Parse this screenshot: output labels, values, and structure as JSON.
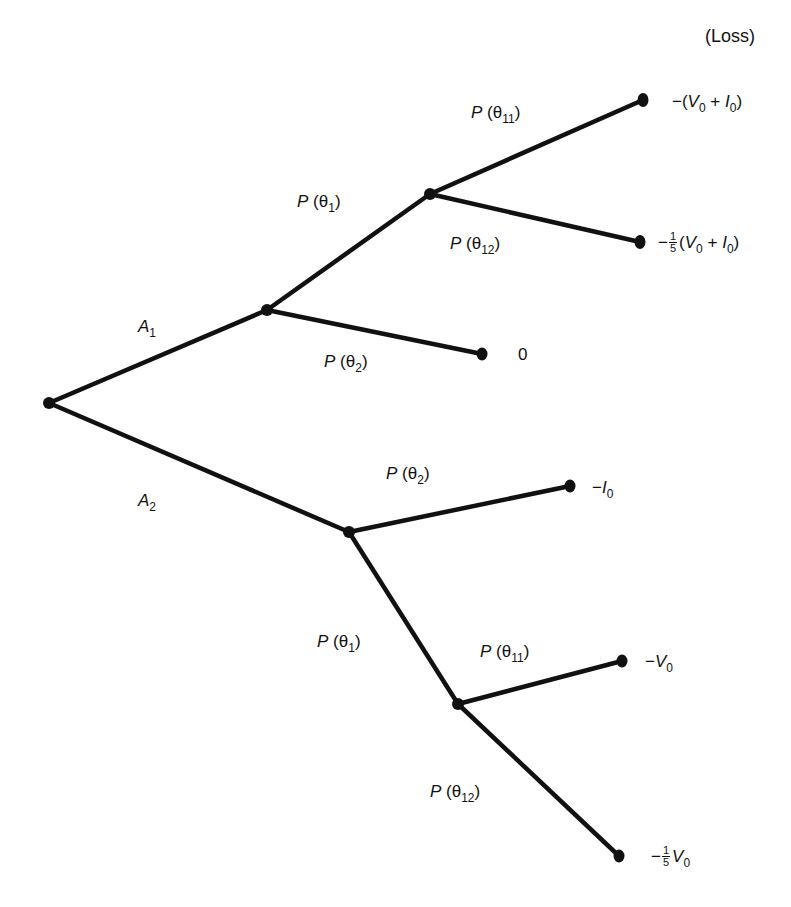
{
  "header": {
    "loss_label": "(Loss)"
  },
  "colors": {
    "line": "#111111",
    "background": "#ffffff"
  },
  "nodes": {
    "root": {
      "x": 49,
      "y": 403
    },
    "a1_chance": {
      "x": 267,
      "y": 310
    },
    "a1_theta1_chance": {
      "x": 430,
      "y": 194
    },
    "a2_chance": {
      "x": 349,
      "y": 532
    },
    "a2_theta1_chance": {
      "x": 458,
      "y": 704
    },
    "leaf_a1_t11": {
      "x": 643,
      "y": 100
    },
    "leaf_a1_t12": {
      "x": 640,
      "y": 242
    },
    "leaf_a1_t2": {
      "x": 482,
      "y": 354
    },
    "leaf_a2_t2": {
      "x": 570,
      "y": 486
    },
    "leaf_a2_t11": {
      "x": 622,
      "y": 661
    },
    "leaf_a2_t12": {
      "x": 619,
      "y": 856
    }
  },
  "branches": {
    "a1": {
      "P": "A",
      "sub": "1"
    },
    "a2": {
      "P": "A",
      "sub": "2"
    },
    "a1_theta1": {
      "P": "P",
      "open": " (θ",
      "sub": "1",
      "close": ")"
    },
    "a1_theta2": {
      "P": "P",
      "open": " (θ",
      "sub": "2",
      "close": ")"
    },
    "a1_theta11": {
      "P": "P",
      "open": " (θ",
      "sub": "11",
      "close": ")"
    },
    "a1_theta12": {
      "P": "P",
      "open": " (θ",
      "sub": "12",
      "close": ")"
    },
    "a2_theta2": {
      "P": "P",
      "open": " (θ",
      "sub": "2",
      "close": ")"
    },
    "a2_theta1": {
      "P": "P",
      "open": " (θ",
      "sub": "1",
      "close": ")"
    },
    "a2_theta11": {
      "P": "P",
      "open": " (θ",
      "sub": "11",
      "close": ")"
    },
    "a2_theta12": {
      "P": "P",
      "open": " (θ",
      "sub": "12",
      "close": ")"
    }
  },
  "outcomes": {
    "a1_t11": {
      "prefix": "−(",
      "v": "V",
      "vsub": "0",
      "plus": " + ",
      "i": "I",
      "isub": "0",
      "suffix": ")"
    },
    "a1_t12": {
      "minus": "−",
      "num": "1",
      "den": "5",
      "open": "(",
      "v": "V",
      "vsub": "0",
      "plus": " + ",
      "i": "I",
      "isub": "0",
      "suffix": ")"
    },
    "a1_t2": {
      "value": "0"
    },
    "a2_t2": {
      "minus": "−",
      "i": "I",
      "isub": "0"
    },
    "a2_t11": {
      "minus": "−",
      "v": "V",
      "vsub": "0"
    },
    "a2_t12": {
      "minus": "−",
      "num": "1",
      "den": "5",
      "v": "V",
      "vsub": "0"
    }
  }
}
